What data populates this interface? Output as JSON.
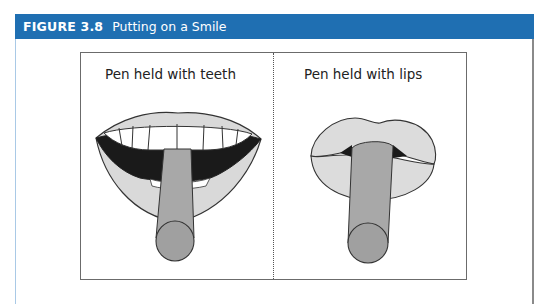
{
  "figure": {
    "number": "FIGURE 3.8",
    "title": "Putting on a Smile",
    "accent_color": "#1f6fb2"
  },
  "panels": [
    {
      "label": "Pen held with teeth",
      "illustration": "open-smile-mouth-with-pen-in-teeth"
    },
    {
      "label": "Pen held with lips",
      "illustration": "pursed-lips-with-pen"
    }
  ]
}
